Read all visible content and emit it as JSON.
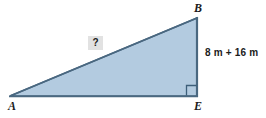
{
  "figure": {
    "type": "right-triangle-diagram",
    "background_color": "#ffffff",
    "fill_color": "#b3cbe0",
    "stroke_color": "#4a6880",
    "label_color": "#1b1b1b",
    "unknown_box_color": "#e2e2e2",
    "vertices": {
      "a_label": "A",
      "b_label": "B",
      "e_label": "E"
    },
    "labels": {
      "vertical_side": "8 m + 16 m",
      "hypotenuse_unknown": "?"
    },
    "right_angle_at": "E"
  }
}
